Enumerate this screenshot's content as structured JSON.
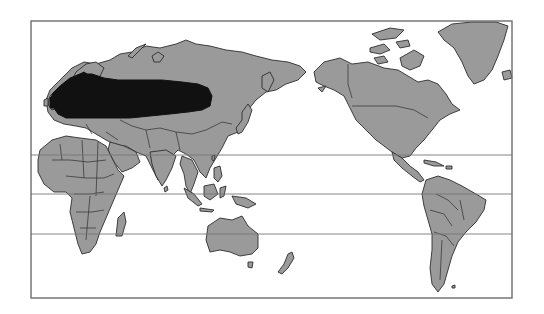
{
  "map": {
    "type": "world distribution map (Pacific-centered)",
    "colors": {
      "background": "#ffffff",
      "land": "#9a9a9a",
      "coastline": "#2e2e2e",
      "distribution_range": "#111111",
      "frame": "#6d6d6d",
      "latitude_lines": "#777777"
    },
    "frame": {
      "x": 31,
      "y": 21,
      "width": 481,
      "height": 277
    },
    "latitude_lines_y": [
      155,
      194,
      234
    ],
    "highlighted_region": {
      "description": "Dark shaded distribution range across Europe and western/central Siberia",
      "extent_px": {
        "x_min": 45,
        "x_max": 212,
        "y_min": 72,
        "y_max": 122
      }
    },
    "labels": []
  }
}
